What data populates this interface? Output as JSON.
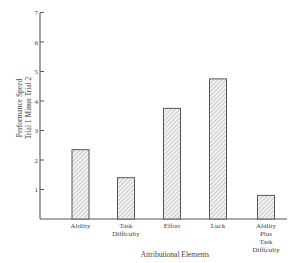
{
  "chart_data": {
    "type": "bar",
    "title": "",
    "xlabel": "Attributional Elements",
    "ylabel": [
      "Performance Speed",
      "Trial 1 Minus Trial 2"
    ],
    "categories": [
      [
        "Ability"
      ],
      [
        "Task",
        "Difficulty"
      ],
      [
        "Effort"
      ],
      [
        "Luck"
      ],
      [
        "Ability",
        "Plus",
        "Task",
        "Difficulty"
      ]
    ],
    "category_names": [
      "Ability",
      "Task Difficulty",
      "Effort",
      "Luck",
      "Ability Plus Task Difficulty"
    ],
    "values": [
      2.35,
      1.4,
      3.75,
      4.75,
      0.8
    ],
    "ylim": [
      0,
      7
    ],
    "yticks": [
      1,
      2,
      3,
      4,
      5,
      6,
      7
    ],
    "grid": false,
    "legend": null,
    "bar_fill": "hatched",
    "colors": {
      "bar_stroke": "#555555",
      "hatch": "#9a9a9a",
      "axis": "#555555"
    }
  }
}
